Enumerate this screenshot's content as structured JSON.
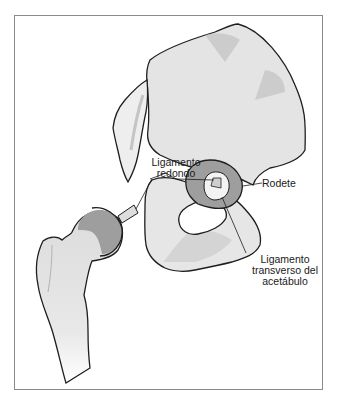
{
  "figure": {
    "structures": [
      "hueso coxal",
      "fémur",
      "cabeza femoral",
      "acetábulo",
      "sacro"
    ],
    "colors": {
      "bone_light": "#e6e6e6",
      "bone_shade": "#cfcfcf",
      "cartilage": "#a9a9a9",
      "outline": "#1e1e1e",
      "frame": "#8a8a8a"
    }
  },
  "labels": {
    "ligamento_redondo": {
      "line1": "Ligamento",
      "line2": "redondo"
    },
    "rodete": {
      "text": "Rodete"
    },
    "ligamento_transverso": {
      "line1": "Ligamento",
      "line2": "transverso del",
      "line3": "acetábulo"
    }
  }
}
